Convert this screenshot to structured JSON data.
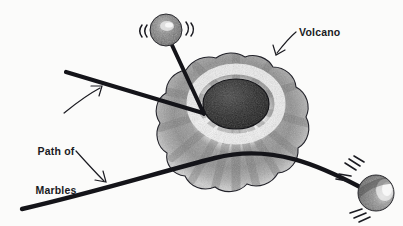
{
  "figure": {
    "kind": "hand-drawn illustration",
    "background_color": "#fbfbfa",
    "ink_color": "#16161c",
    "pencil_gray": "#8d8d8d",
    "width": 403,
    "height": 226
  },
  "labels": {
    "volcano": "Volcano",
    "path_line1": "Path of",
    "path_line2": "Marbles"
  },
  "annotations": [
    {
      "name": "volcano-callout-arrow",
      "points_to": "volcano-body",
      "direction": "down-left"
    },
    {
      "name": "path-upper-callout-arrow",
      "points_to": "upper-path-line",
      "direction": "up-right"
    },
    {
      "name": "path-lower-callout-arrow",
      "points_to": "lower-path-line",
      "direction": "down-right"
    }
  ],
  "objects": {
    "volcano": {
      "name": "volcano-body",
      "shape": "lobed blob with shaded radial texture",
      "crater": "dark filled ellipse near top center"
    },
    "marbles": [
      {
        "name": "marble-top",
        "position": "upper-left above volcano",
        "motion_marks": "(( on left, )) on right"
      },
      {
        "name": "marble-right",
        "position": "lower-right of volcano",
        "motion_marks": "three strokes upper-left, two strokes left, three strokes lower-left"
      }
    ],
    "paths": [
      {
        "name": "upper-path-line",
        "description": "thick straight line from upper-left descending into volcano crater rim"
      },
      {
        "name": "lower-path-line",
        "description": "thick gently curving line from lower-left across volcano to right marble"
      },
      {
        "name": "marble-top-path-line",
        "description": "thick line from top marble descending to volcano rim"
      }
    ]
  }
}
